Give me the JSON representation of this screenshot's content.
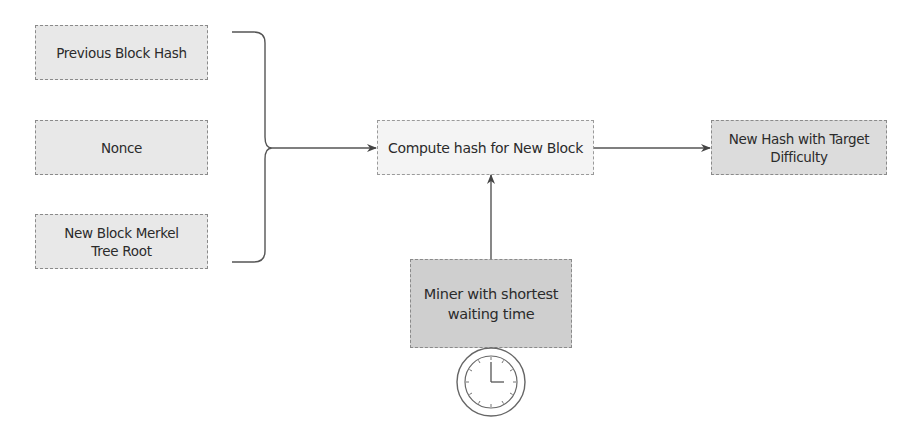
{
  "diagram": {
    "inputs": [
      {
        "label": "Previous Block Hash"
      },
      {
        "label": "Nonce"
      },
      {
        "label": "New Block Merkel Tree Root"
      }
    ],
    "process": {
      "label": "Compute hash for New Block"
    },
    "output": {
      "label": "New Hash with Target Difficulty"
    },
    "miner": {
      "label": "Miner with shortest waiting time",
      "icon": "clock-icon"
    },
    "edges": [
      {
        "from": "inputs (brace)",
        "to": "Compute hash for New Block"
      },
      {
        "from": "Compute hash for New Block",
        "to": "New Hash with Target Difficulty"
      },
      {
        "from": "Miner with shortest waiting time",
        "to": "Compute hash for New Block"
      }
    ]
  }
}
